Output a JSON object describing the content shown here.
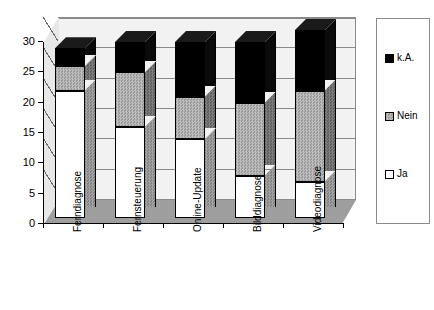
{
  "chart_data": {
    "type": "bar",
    "subtype": "stacked-3d-column",
    "title": "",
    "xlabel": "",
    "ylabel": "",
    "ylim": [
      0,
      30
    ],
    "yticks": [
      0,
      5,
      10,
      15,
      20,
      25,
      30
    ],
    "grid": true,
    "legend_position": "right",
    "categories": [
      "Ferndiagnose",
      "Fernsteuerung",
      "Online-Update",
      "Bilddiagnose",
      "Videodiagnose"
    ],
    "series": [
      {
        "name": "Ja",
        "color": "#ffffff",
        "values": [
          21,
          15,
          13,
          7,
          6
        ]
      },
      {
        "name": "Nein",
        "color": "#a8a8a8",
        "values": [
          4,
          9,
          7,
          12,
          15
        ]
      },
      {
        "name": "k.A.",
        "color": "#000000",
        "values": [
          3,
          5,
          9,
          10,
          10
        ]
      }
    ],
    "totals": [
      28,
      29,
      29,
      29,
      31
    ]
  },
  "axis": {
    "y_tick_labels": [
      "0",
      "5",
      "10",
      "15",
      "20",
      "25",
      "30"
    ]
  },
  "legend": {
    "items": [
      {
        "label": "k.A.",
        "swatch": "black-square-icon"
      },
      {
        "label": "Nein",
        "swatch": "gray-square-icon"
      },
      {
        "label": "Ja",
        "swatch": "white-square-icon"
      }
    ]
  }
}
